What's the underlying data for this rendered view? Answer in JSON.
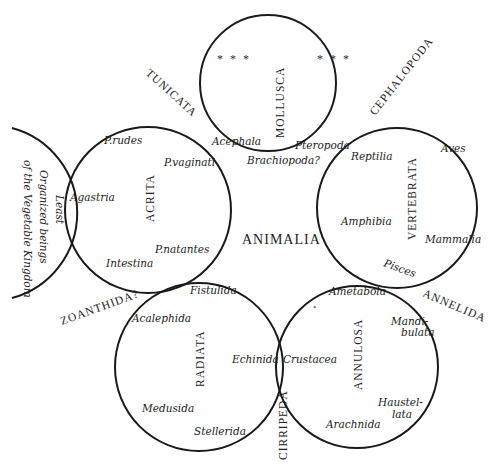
{
  "title": "ANIMALIA",
  "groups": {
    "mollusca": {
      "label": "MOLLUSCA",
      "members": [
        "Acephala",
        "Pteropoda"
      ],
      "ellipsis_left": "* * *",
      "ellipsis_right": "* * *",
      "bottom_member": "Brachiopoda?"
    },
    "acrita": {
      "label": "ACRITA",
      "members": [
        "P.rudes",
        "P.vaginati",
        "Agastria",
        "P.natantes",
        "Intestina"
      ]
    },
    "vertebrata": {
      "label": "VERTEBRATA",
      "members": [
        "Reptilia",
        "Aves",
        "Amphibia",
        "Mammalia",
        "Pisces"
      ]
    },
    "radiata": {
      "label": "RADIATA",
      "members": [
        "Fistulida",
        "Acalephida",
        "Echinida",
        "Medusida",
        "Stellerida"
      ]
    },
    "annulosa": {
      "label": "ANNULOSA",
      "members": [
        "Ametabola",
        "Mandi-",
        "bulata",
        "Crustacea",
        "Haustel-",
        "lata",
        "Arachnida"
      ]
    }
  },
  "vegetable": {
    "lines": [
      "Least",
      "Organized beings",
      "of the Vegetable Kingdom"
    ]
  },
  "osculants": {
    "tunicata": "TUNICATA",
    "cephalopoda": "CEPHALOPODA",
    "zoanthida": "ZOANTHIDA?",
    "annelida": "ANNELIDA",
    "cirripeda": "CIRRIPEDA"
  }
}
